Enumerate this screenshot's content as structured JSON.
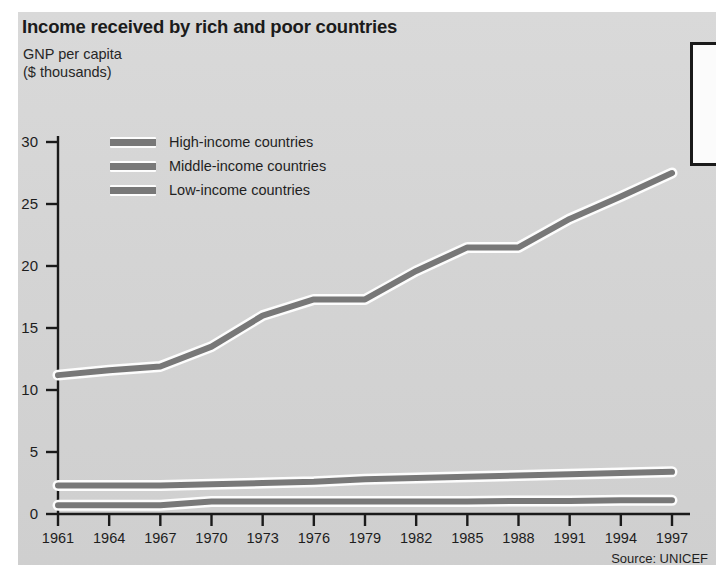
{
  "chart_data": {
    "type": "line",
    "title": "Income received by rich and poor countries",
    "subtitle_lines": [
      "GNP per capita",
      "($ thousands)"
    ],
    "ylabel": "GNP per capita ($ thousands)",
    "xlabel": "",
    "source": "Source: UNICEF",
    "grid": false,
    "legend_position": "upper-left-inside",
    "xlim": [
      1961,
      1997
    ],
    "ylim": [
      0,
      32
    ],
    "ytick_values": [
      0,
      5,
      10,
      15,
      20,
      25,
      30
    ],
    "xtick_values": [
      1961,
      1964,
      1967,
      1970,
      1973,
      1976,
      1979,
      1982,
      1985,
      1988,
      1991,
      1994,
      1997
    ],
    "x": [
      1961,
      1964,
      1967,
      1970,
      1973,
      1976,
      1979,
      1982,
      1985,
      1988,
      1991,
      1994,
      1997
    ],
    "series": [
      {
        "name": "High-income countries",
        "color": "#787878",
        "values": [
          11.2,
          11.6,
          11.9,
          13.5,
          16.0,
          17.3,
          17.3,
          19.6,
          21.5,
          21.5,
          23.8,
          25.6,
          27.5
        ]
      },
      {
        "name": "Middle-income countries",
        "color": "#787878",
        "values": [
          2.3,
          2.3,
          2.3,
          2.4,
          2.5,
          2.6,
          2.8,
          2.9,
          3.0,
          3.1,
          3.2,
          3.3,
          3.4
        ]
      },
      {
        "name": "Low-income countries",
        "color": "#787878",
        "values": [
          0.7,
          0.7,
          0.7,
          1.0,
          1.0,
          1.0,
          1.0,
          1.0,
          1.0,
          1.05,
          1.05,
          1.1,
          1.1
        ]
      }
    ]
  },
  "chart": {
    "title": "Income received by rich and poor countries",
    "axis_caption": "GNP per capita\n($ thousands)",
    "source": "Source: UNICEF",
    "legend": [
      {
        "label": "High-income countries"
      },
      {
        "label": "Middle-income countries"
      },
      {
        "label": "Low-income countries"
      }
    ],
    "ytick_labels": [
      "30",
      "25",
      "20",
      "15",
      "10",
      "5",
      "0"
    ],
    "xtick_labels": [
      "1961",
      "1964",
      "1967",
      "1970",
      "1973",
      "1976",
      "1979",
      "1982",
      "1985",
      "1988",
      "1991",
      "1994",
      "1997"
    ]
  },
  "colors": {
    "panel_background": "#d5d5d5",
    "line": "#787878",
    "line_highlight": "#fdfdfd",
    "axis": "#1a1a1a",
    "text": "#1d1d1d",
    "callout_border": "#1a1a1a",
    "callout_fill": "#fbfbfb"
  }
}
